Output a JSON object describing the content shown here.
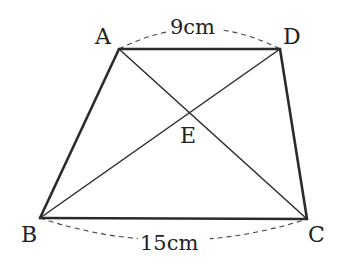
{
  "diagram": {
    "type": "trapezoid-with-diagonals",
    "vertices": {
      "A": {
        "label": "A",
        "x": 119,
        "y": 49
      },
      "D": {
        "label": "D",
        "x": 280,
        "y": 49
      },
      "B": {
        "label": "B",
        "x": 40,
        "y": 218
      },
      "C": {
        "label": "C",
        "x": 307,
        "y": 219
      },
      "E": {
        "label": "E",
        "x": 190,
        "y": 113
      }
    },
    "measurements": {
      "top": "9cm",
      "bottom": "15cm"
    },
    "colors": {
      "line": "#2b2b2b",
      "dashed": "#444444",
      "text": "#222222",
      "background": "#ffffff"
    }
  }
}
